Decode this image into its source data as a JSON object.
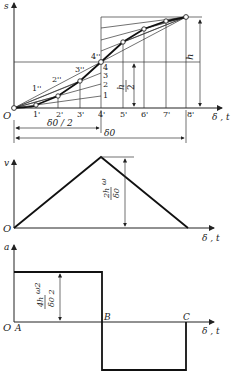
{
  "diagram": {
    "displacement_plot": {
      "y_axis_label": "s",
      "x_axis_label": "δ , t",
      "origin_label": "O",
      "x_ticks": [
        "1'",
        "2'",
        "3'",
        "4'",
        "5'",
        "6'",
        "7'",
        "8'"
      ],
      "left_divisions": [
        "1",
        "2",
        "3",
        "4"
      ],
      "ray_labels": [
        "1''",
        "2''",
        "3''",
        "4''"
      ],
      "height_label": "h",
      "half_height_num": "h",
      "half_height_den": "2",
      "half_span_label": "δ0 / 2",
      "full_span_label": "δ0"
    },
    "velocity_plot": {
      "y_axis_label": "v",
      "x_axis_label": "δ , t",
      "origin_label": "O",
      "peak_label_num": "2h",
      "peak_label_omega": "ω",
      "peak_label_den": "δ0"
    },
    "acceleration_plot": {
      "y_axis_label": "a",
      "x_axis_label": "δ , t",
      "origin_label": "O",
      "point_A": "A",
      "point_B": "B",
      "point_C": "C",
      "level_label_num": "4h",
      "level_label_omega": "ω2",
      "level_label_den": "δ0 2"
    }
  },
  "colors": {
    "line": "#111111",
    "background": "#ffffff"
  }
}
